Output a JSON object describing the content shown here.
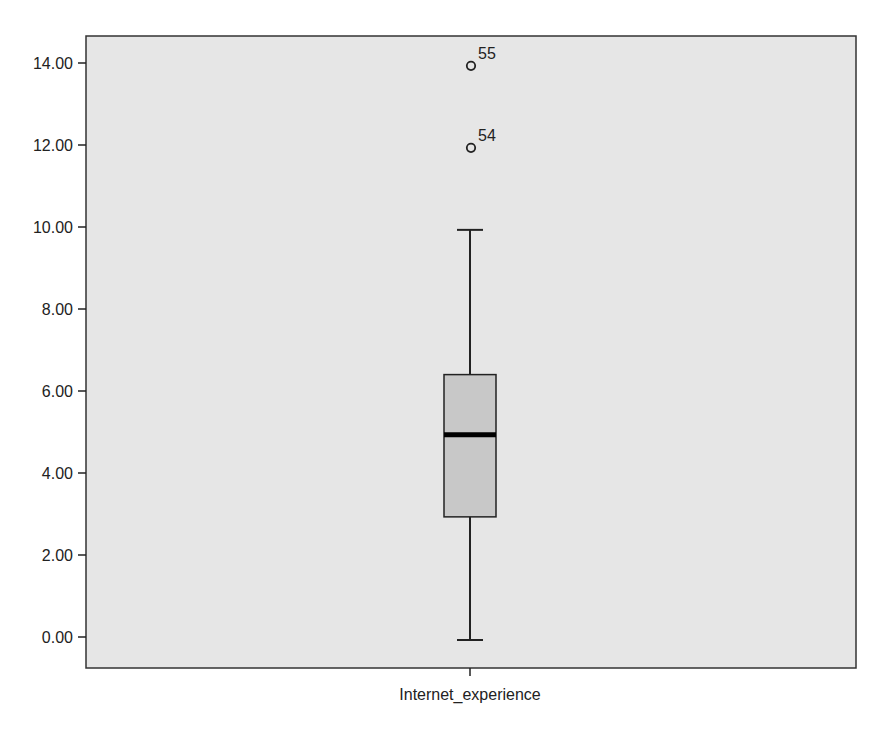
{
  "chart_data": {
    "type": "box",
    "title": "",
    "xlabel": "",
    "ylabel": "",
    "categories": [
      "Internet_experience"
    ],
    "ylim": [
      -0.7,
      14.7
    ],
    "yticks": [
      0,
      2,
      4,
      6,
      8,
      10,
      12,
      14
    ],
    "ytick_labels": [
      "0.00",
      "2.00",
      "4.00",
      "6.00",
      "8.00",
      "10.00",
      "12.00",
      "14.00"
    ],
    "grid": false,
    "legend": null,
    "series": [
      {
        "name": "Internet_experience",
        "whisker_low": 0.0,
        "q1": 2.93,
        "median": 4.93,
        "q3": 6.4,
        "whisker_high": 9.93,
        "outliers": [
          {
            "value": 13.93,
            "label": "55"
          },
          {
            "value": 11.93,
            "label": "54"
          }
        ]
      }
    ]
  },
  "colors": {
    "plot_background": "#e6e6e6",
    "box_fill": "#c8c8c8",
    "line": "#222222",
    "page_background": "#ffffff"
  }
}
